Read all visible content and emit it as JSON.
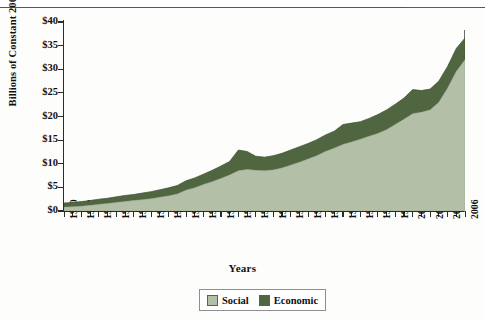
{
  "chart_data": {
    "type": "area",
    "stacked": true,
    "title": "",
    "xlabel": "Years",
    "ylabel": "Billions of Constant 2000 Dollars",
    "xlim": [
      1960,
      2006
    ],
    "ylim": [
      0,
      40
    ],
    "ytick_step": 5,
    "ytick_labels": [
      "$0",
      "$5",
      "$10",
      "$15",
      "$20",
      "$25",
      "$30",
      "$35",
      "$40"
    ],
    "ytick_values": [
      0,
      5,
      10,
      15,
      20,
      25,
      30,
      35,
      40
    ],
    "xtick_labels": [
      "1960",
      "1962",
      "1964",
      "1966",
      "1968",
      "1970",
      "1972",
      "1974",
      "1976",
      "1978",
      "1980",
      "1982",
      "1984",
      "1986",
      "1988",
      "1990",
      "1992",
      "1994",
      "1996",
      "1998",
      "2000",
      "2002",
      "2004",
      "2006"
    ],
    "xtick_minor_every": 1,
    "grid": false,
    "legend_position": "bottom",
    "x": [
      1960,
      1961,
      1962,
      1963,
      1964,
      1965,
      1966,
      1967,
      1968,
      1969,
      1970,
      1971,
      1972,
      1973,
      1974,
      1975,
      1976,
      1977,
      1978,
      1979,
      1980,
      1981,
      1982,
      1983,
      1984,
      1985,
      1986,
      1987,
      1988,
      1989,
      1990,
      1991,
      1992,
      1993,
      1994,
      1995,
      1996,
      1997,
      1998,
      1999,
      2000,
      2001,
      2002,
      2003,
      2004,
      2005,
      2006
    ],
    "series": [
      {
        "name": "Social",
        "color": "#b3c0a7",
        "values": [
          0.8,
          0.9,
          1.0,
          1.2,
          1.4,
          1.6,
          1.8,
          2.0,
          2.2,
          2.4,
          2.6,
          2.9,
          3.2,
          3.6,
          4.4,
          4.9,
          5.6,
          6.2,
          6.9,
          7.6,
          8.5,
          8.8,
          8.6,
          8.5,
          8.7,
          9.1,
          9.7,
          10.3,
          11.0,
          11.7,
          12.6,
          13.3,
          14.1,
          14.6,
          15.2,
          15.8,
          16.4,
          17.2,
          18.3,
          19.4,
          20.6,
          20.9,
          21.4,
          23.0,
          26.0,
          29.5,
          32.0
        ]
      },
      {
        "name": "Economic",
        "color": "#4f6640",
        "values": [
          0.9,
          0.9,
          1.0,
          1.0,
          1.1,
          1.1,
          1.2,
          1.3,
          1.3,
          1.4,
          1.5,
          1.6,
          1.7,
          1.8,
          2.0,
          2.1,
          2.2,
          2.4,
          2.6,
          2.9,
          4.4,
          3.8,
          3.0,
          2.9,
          3.0,
          3.1,
          3.2,
          3.3,
          3.3,
          3.4,
          3.5,
          3.6,
          4.2,
          4.0,
          3.7,
          3.8,
          4.0,
          4.2,
          4.3,
          4.5,
          5.1,
          4.6,
          4.4,
          4.5,
          4.6,
          4.9,
          4.6
        ]
      }
    ],
    "totals": [
      1.7,
      1.8,
      2.0,
      2.2,
      2.5,
      2.7,
      3.0,
      3.3,
      3.5,
      3.8,
      4.1,
      4.5,
      4.9,
      5.4,
      6.4,
      7.0,
      7.8,
      8.6,
      9.5,
      10.5,
      12.9,
      12.6,
      11.6,
      11.4,
      11.7,
      12.2,
      12.9,
      13.6,
      14.3,
      15.1,
      16.1,
      16.9,
      18.3,
      18.6,
      18.9,
      19.6,
      20.4,
      21.4,
      22.6,
      23.9,
      25.7,
      25.5,
      25.8,
      27.5,
      30.6,
      34.4,
      36.6
    ]
  },
  "legend": {
    "items": [
      {
        "label": "Social",
        "color": "#b3c0a7"
      },
      {
        "label": "Economic",
        "color": "#4f6640"
      }
    ]
  }
}
